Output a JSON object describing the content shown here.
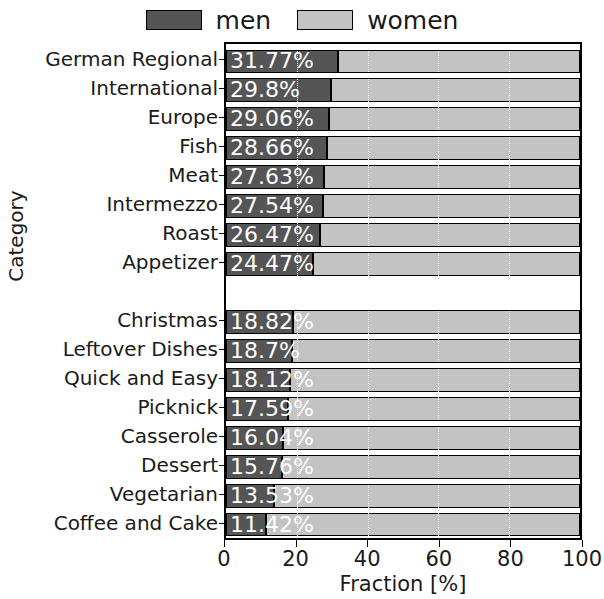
{
  "chart_data": {
    "type": "bar",
    "orientation": "horizontal",
    "stacked": true,
    "title": "",
    "xlabel": "Fraction [%]",
    "ylabel": "Category",
    "xlim": [
      0,
      100
    ],
    "xticks": [
      "0",
      "20",
      "40",
      "60",
      "80",
      "100"
    ],
    "xtick_values": [
      0,
      20,
      40,
      60,
      80,
      100
    ],
    "grid": true,
    "grid_axis": "x",
    "grid_style": "dotted-white",
    "legend": {
      "position": "top-center",
      "entries": [
        {
          "name": "men",
          "color": "#555555"
        },
        {
          "name": "women",
          "color": "#c3c3c3"
        }
      ]
    },
    "categories": [
      "German Regional",
      "International",
      "Europe",
      "Fish",
      "Meat",
      "Intermezzo",
      "Roast",
      "Appetizer",
      "Christmas",
      "Leftover Dishes",
      "Quick and Easy",
      "Picknick",
      "Casserole",
      "Dessert",
      "Vegetarian",
      "Coffee and Cake"
    ],
    "group_break_after_index": 7,
    "series": [
      {
        "name": "men",
        "values": [
          31.77,
          29.8,
          29.06,
          28.66,
          27.63,
          27.54,
          26.47,
          24.47,
          18.82,
          18.7,
          18.12,
          17.59,
          16.04,
          15.76,
          13.53,
          11.42
        ]
      },
      {
        "name": "women",
        "values": [
          68.23,
          70.2,
          70.94,
          71.34,
          72.37,
          72.46,
          73.53,
          75.53,
          81.18,
          81.3,
          81.88,
          82.41,
          83.96,
          84.24,
          86.47,
          88.58
        ]
      }
    ],
    "bar_labels": [
      "31.77%",
      "29.8%",
      "29.06%",
      "28.66%",
      "27.63%",
      "27.54%",
      "26.47%",
      "24.47%",
      "18.82%",
      "18.7%",
      "18.12%",
      "17.59%",
      "16.04%",
      "15.76%",
      "13.53%",
      "11.42%"
    ]
  }
}
